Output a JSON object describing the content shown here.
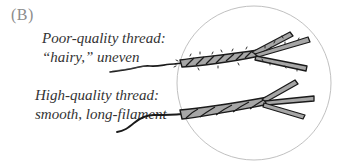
{
  "figure": {
    "panel_label": "(B)",
    "captions": {
      "poor": {
        "line1": "Poor-quality thread:",
        "line2": "“hairy,” uneven"
      },
      "high": {
        "line1": "High-quality thread:",
        "line2": "smooth, long-filament"
      }
    },
    "colors": {
      "thread_fill": "#a6a6a6",
      "outline": "#1a1a1a",
      "circle": "#b0b0b0",
      "label": "#8c8c8c"
    }
  }
}
